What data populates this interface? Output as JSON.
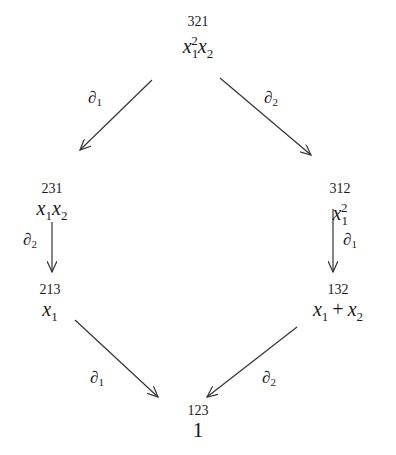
{
  "diagram": {
    "nodes": [
      {
        "id": "top",
        "perm": "321",
        "poly": {
          "t1": "x",
          "s1": "1",
          "p1": "2",
          "t2": "x",
          "s2": "2"
        }
      },
      {
        "id": "mid-left",
        "perm": "231",
        "poly": {
          "t1": "x",
          "s1": "1",
          "t2": "x",
          "s2": "2"
        }
      },
      {
        "id": "mid-right",
        "perm": "312",
        "poly": {
          "t1": "x",
          "s1": "1",
          "p1": "2"
        }
      },
      {
        "id": "low-left",
        "perm": "213",
        "poly": {
          "t1": "x",
          "s1": "1"
        }
      },
      {
        "id": "low-right",
        "perm": "132",
        "poly": {
          "t1": "x",
          "s1": "1",
          "op": "+",
          "t2": "x",
          "s2": "2"
        }
      },
      {
        "id": "bottom",
        "perm": "123",
        "poly": {
          "t1": "1"
        }
      }
    ],
    "edges": [
      {
        "from": "321",
        "to": "231",
        "label": "∂",
        "sub": "1"
      },
      {
        "from": "321",
        "to": "312",
        "label": "∂",
        "sub": "2"
      },
      {
        "from": "231",
        "to": "213",
        "label": "∂",
        "sub": "2"
      },
      {
        "from": "312",
        "to": "132",
        "label": "∂",
        "sub": "1"
      },
      {
        "from": "213",
        "to": "123",
        "label": "∂",
        "sub": "1"
      },
      {
        "from": "132",
        "to": "123",
        "label": "∂",
        "sub": "2"
      }
    ],
    "colors": {
      "ink": "#1a1a1a",
      "arrow": "#333333",
      "background": "#ffffff"
    }
  }
}
